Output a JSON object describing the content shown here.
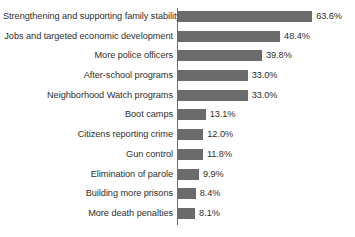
{
  "chart_data": {
    "type": "bar",
    "orientation": "horizontal",
    "title": "",
    "subtitle": "",
    "xlabel": "",
    "ylabel": "",
    "xlim": [
      0,
      63.6
    ],
    "grid": false,
    "legend": false,
    "value_suffix": "%",
    "bar_color": "#6b6b6b",
    "axis_color": "#6f6f6f",
    "text_color": "#2e2e2e",
    "background_color": "#ffffff",
    "categories": [
      "Strengthening and supporting family stability",
      "Jobs and targeted economic development",
      "More police officers",
      "After-school programs",
      "Neighborhood Watch programs",
      "Boot camps",
      "Citizens reporting crime",
      "Gun control",
      "Elimination of parole",
      "Building more prisons",
      "More death penalties"
    ],
    "values": [
      63.6,
      48.4,
      39.8,
      33.0,
      33.0,
      13.1,
      12.0,
      11.8,
      9.9,
      8.4,
      8.1
    ],
    "value_labels": [
      "63.6%",
      "48.4%",
      "39.8%",
      "33.0%",
      "33.0%",
      "13.1%",
      "12.0%",
      "11.8%",
      "9.9%",
      "8.4%",
      "8.1%"
    ]
  }
}
